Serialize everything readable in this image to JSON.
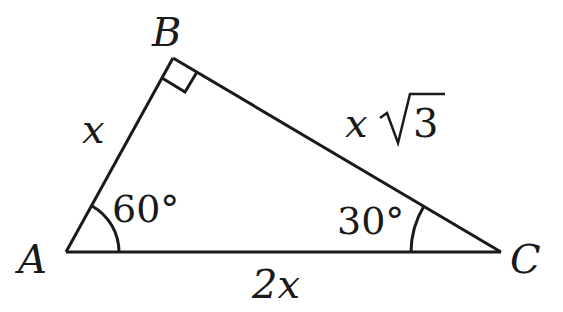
{
  "diagram": {
    "type": "right-triangle",
    "vertices": {
      "A": {
        "label": "A",
        "x": 66,
        "y": 252
      },
      "B": {
        "label": "B",
        "x": 173,
        "y": 58
      },
      "C": {
        "label": "C",
        "x": 501,
        "y": 252
      }
    },
    "sides": {
      "AB": {
        "label": "x"
      },
      "BC": {
        "label_var": "x",
        "label_radicand": "3"
      },
      "AC": {
        "label": "2x"
      }
    },
    "angles": {
      "A": {
        "label": "60°"
      },
      "C": {
        "label": "30°"
      },
      "B": {
        "marker": "right-angle"
      }
    },
    "colors": {
      "stroke": "#1a1a1a",
      "background": "#ffffff"
    }
  }
}
